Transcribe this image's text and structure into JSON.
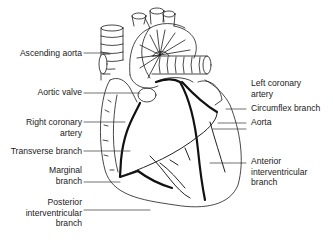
{
  "diagram": {
    "colors": {
      "line": "#1a1a1a",
      "artery": "#111111",
      "background": "#ffffff"
    },
    "labels_left": [
      {
        "id": "ascending-aorta",
        "lines": [
          "Ascending aorta"
        ]
      },
      {
        "id": "aortic-valve",
        "lines": [
          "Aortic valve"
        ]
      },
      {
        "id": "right-coronary-artery",
        "lines": [
          "Right coronary",
          "artery"
        ]
      },
      {
        "id": "transverse-branch",
        "lines": [
          "Transverse branch"
        ]
      },
      {
        "id": "marginal-branch",
        "lines": [
          "Marginal",
          "branch"
        ]
      },
      {
        "id": "posterior-interventricular-branch",
        "lines": [
          "Posterior",
          "interventricular",
          "branch"
        ]
      }
    ],
    "labels_right": [
      {
        "id": "left-coronary-artery",
        "lines": [
          "Left coronary",
          "artery"
        ]
      },
      {
        "id": "circumflex-branch",
        "lines": [
          "Circumflex branch"
        ]
      },
      {
        "id": "aorta",
        "lines": [
          "Aorta"
        ]
      },
      {
        "id": "anterior-interventricular-branch",
        "lines": [
          "Anterior",
          "interventricular",
          "branch"
        ]
      }
    ]
  }
}
